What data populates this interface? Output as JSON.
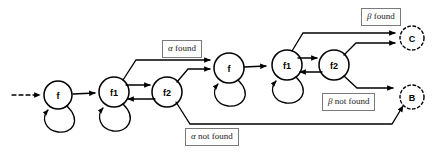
{
  "diagram": {
    "type": "state-machine-flow-diagram",
    "stroke_color": "#000000",
    "label_border_color": "#7a7a7a",
    "background": "#ffffff",
    "nodes": [
      {
        "id": "f_start",
        "label": "f",
        "shape": "circle",
        "cx": 58,
        "cy": 95,
        "r": 14,
        "self_loop": true
      },
      {
        "id": "f1_left",
        "label": "f1",
        "shape": "circle",
        "cx": 114,
        "cy": 92,
        "r": 15,
        "self_loop": true
      },
      {
        "id": "f2_left",
        "label": "f2",
        "shape": "circle",
        "cx": 167,
        "cy": 92,
        "r": 15,
        "self_loop": false
      },
      {
        "id": "f_mid",
        "label": "f",
        "shape": "circle",
        "cx": 229,
        "cy": 68,
        "r": 15,
        "self_loop": true
      },
      {
        "id": "f1_right",
        "label": "f1",
        "shape": "circle",
        "cx": 287,
        "cy": 65,
        "r": 15,
        "self_loop": true
      },
      {
        "id": "f2_right",
        "label": "f2",
        "shape": "circle",
        "cx": 334,
        "cy": 65,
        "r": 15,
        "self_loop": false
      },
      {
        "id": "C",
        "label": "C",
        "shape": "dashed-circle",
        "cx": 412,
        "cy": 38,
        "r": 12,
        "self_loop": false
      },
      {
        "id": "B",
        "label": "B",
        "shape": "dashed-circle",
        "cx": 412,
        "cy": 97,
        "r": 12,
        "self_loop": false
      }
    ],
    "edge_labels": [
      {
        "id": "alpha-found",
        "greek": "α",
        "text": " found",
        "x": 162,
        "y": 40
      },
      {
        "id": "beta-found",
        "greek": "β",
        "text": " found",
        "x": 361,
        "y": 8
      },
      {
        "id": "beta-not-found",
        "greek": "β",
        "text": " not found",
        "x": 322,
        "y": 93
      },
      {
        "id": "alpha-not-found",
        "greek": "α",
        "text": " not found",
        "x": 185,
        "y": 128
      }
    ],
    "edges": [
      {
        "id": "entry-arrow",
        "from": "start",
        "to": "f_start",
        "style": "dashed"
      },
      {
        "id": "f-to-f1",
        "from": "f_start",
        "to": "f1_left",
        "style": "solid"
      },
      {
        "id": "f1-to-f2-left",
        "from": "f1_left",
        "to": "f2_left",
        "style": "solid"
      },
      {
        "id": "f2-to-f1-left",
        "from": "f2_left",
        "to": "f1_left",
        "style": "solid"
      },
      {
        "id": "f1-left-to-f-mid",
        "from": "f1_left",
        "to": "f_mid",
        "style": "solid",
        "label": "alpha-found"
      },
      {
        "id": "f2-left-to-f-mid",
        "from": "f2_left",
        "to": "f_mid",
        "style": "solid",
        "label": "alpha-found"
      },
      {
        "id": "f-mid-to-f1-right",
        "from": "f_mid",
        "to": "f1_right",
        "style": "solid"
      },
      {
        "id": "f1-to-f2-right",
        "from": "f1_right",
        "to": "f2_right",
        "style": "solid"
      },
      {
        "id": "f2-to-f1-right",
        "from": "f2_right",
        "to": "f1_right",
        "style": "solid"
      },
      {
        "id": "f1-right-to-C",
        "from": "f1_right",
        "to": "C",
        "style": "solid",
        "label": "beta-found"
      },
      {
        "id": "f2-right-to-C",
        "from": "f2_right",
        "to": "C",
        "style": "solid",
        "label": "beta-found"
      },
      {
        "id": "f2-right-to-B",
        "from": "f2_right",
        "to": "B",
        "style": "solid",
        "label": "beta-not-found"
      },
      {
        "id": "f2-left-to-B",
        "from": "f2_left",
        "to": "B",
        "style": "solid",
        "label": "alpha-not-found"
      }
    ]
  }
}
